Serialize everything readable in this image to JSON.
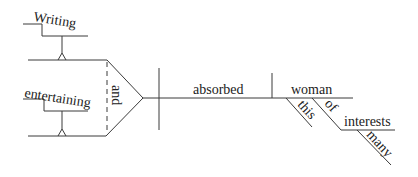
{
  "diagram": {
    "type": "Reed-Kellogg sentence diagram",
    "sentence": "Writing and entertaining absorbed this woman of many interests",
    "words": {
      "gerund_1": "Writing",
      "conjunction": "and",
      "gerund_2": "entertaining",
      "verb": "absorbed",
      "object": "woman",
      "object_modifier": "this",
      "preposition": "of",
      "prep_object": "interests",
      "prep_object_modifier": "many"
    }
  }
}
